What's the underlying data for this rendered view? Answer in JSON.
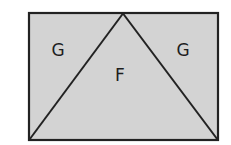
{
  "diagram": {
    "type": "geometry",
    "fill_color": "#d3d3d3",
    "stroke_color": "#222222",
    "rectangle": {
      "x1": 29,
      "y1": 13,
      "x2": 218,
      "y2": 140
    },
    "triangle": {
      "apex": [
        123,
        13
      ],
      "base_left": [
        29,
        140
      ],
      "base_right": [
        218,
        140
      ]
    },
    "regions": [
      {
        "id": "left",
        "label": "G",
        "x": 58,
        "y": 50
      },
      {
        "id": "center",
        "label": "F",
        "x": 120,
        "y": 75
      },
      {
        "id": "right",
        "label": "G",
        "x": 183,
        "y": 50
      }
    ]
  }
}
